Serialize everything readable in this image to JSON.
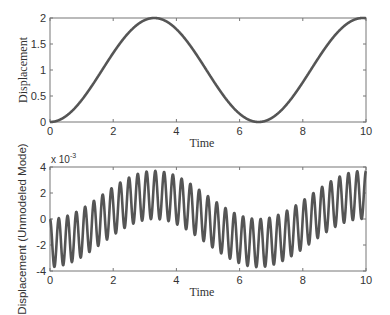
{
  "chart_data": [
    {
      "type": "line",
      "title": "",
      "xlabel": "Time",
      "ylabel": "Displacement",
      "xlim": [
        0,
        10
      ],
      "ylim": [
        0,
        2
      ],
      "xticks": [
        "0",
        "2",
        "4",
        "6",
        "8",
        "10"
      ],
      "yticks": [
        "0",
        "0.5",
        "1",
        "1.5",
        "2"
      ],
      "grid": false,
      "legend": null,
      "line_color": "#555555",
      "model": "y = 1 - cos(2*pi*t/6.6)",
      "x": [
        0,
        0.5,
        1,
        1.5,
        2,
        2.5,
        3,
        3.5,
        4,
        4.5,
        5,
        5.5,
        6,
        6.5,
        7,
        7.5,
        8,
        8.5,
        9,
        9.5,
        10
      ],
      "series": [
        {
          "name": "Displacement",
          "values": [
            0.0,
            0.11,
            0.42,
            0.85,
            1.32,
            1.72,
            1.96,
            1.98,
            1.81,
            1.44,
            0.96,
            0.49,
            0.16,
            0.0,
            0.04,
            0.28,
            0.68,
            1.16,
            1.6,
            1.91,
            1.99
          ]
        }
      ]
    },
    {
      "type": "line",
      "title": "",
      "xlabel": "Time",
      "ylabel": "Displacement (Unmodeled Mode)",
      "y_multiplier": "x 10",
      "y_multiplier_exp": "-3",
      "xlim": [
        0,
        10
      ],
      "ylim": [
        -4,
        4
      ],
      "xticks": [
        "0",
        "2",
        "4",
        "6",
        "8",
        "10"
      ],
      "yticks": [
        "-4",
        "-2",
        "0",
        "2",
        "4"
      ],
      "grid": false,
      "legend": null,
      "line_color": "#555555",
      "model": "y(1e-3) = -1.85*cos(2*pi*t/6.6) + 1.85*cos(2*pi*3.6*t)",
      "envelope_center_x": [
        0,
        1,
        2,
        3,
        3.3,
        4,
        5,
        6,
        6.6,
        7,
        8,
        9,
        10
      ],
      "envelope_center_values": [
        -1.85,
        -1.43,
        -0.39,
        0.8,
        1.85,
        1.62,
        0.7,
        -0.57,
        -1.85,
        -1.78,
        -0.95,
        0.28,
        1.49
      ],
      "oscillation_amplitude": 1.85,
      "oscillation_cycles": 36,
      "series": [
        {
          "name": "Displacement (Unmodeled Mode)",
          "peak_max": 3.6,
          "trough_min": -3.7
        }
      ]
    }
  ],
  "params": {
    "top": {
      "slow_period": 6.6,
      "offset": 1.0,
      "amp": 1.0
    },
    "bottom": {
      "slow_period": 6.6,
      "slow_amp": 1.85,
      "fast_freq": 3.6,
      "fast_amp": 1.85
    }
  }
}
